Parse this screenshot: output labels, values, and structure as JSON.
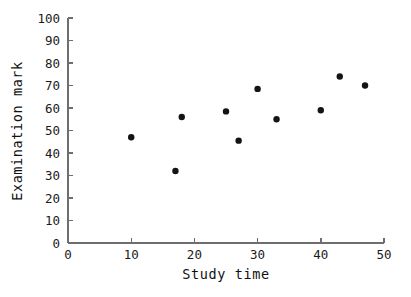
{
  "chart_data": {
    "type": "scatter",
    "title": "",
    "xlabel": "Study time",
    "ylabel": "Examination mark",
    "xlim": [
      0,
      50
    ],
    "ylim": [
      0,
      100
    ],
    "xticks": [
      0,
      10,
      20,
      30,
      40,
      50
    ],
    "yticks": [
      0,
      10,
      20,
      30,
      40,
      50,
      60,
      70,
      80,
      90,
      100
    ],
    "xtick_labels": [
      "0",
      "10",
      "20",
      "30",
      "40",
      "50"
    ],
    "ytick_labels": [
      "0",
      "10",
      "20",
      "30",
      "40",
      "50",
      "60",
      "70",
      "80",
      "90",
      "100"
    ],
    "grid": false,
    "legend": null,
    "marker": "filled-circle",
    "marker_color": "#141414",
    "axis_color": "#6e6e6e",
    "points": [
      {
        "x": 10,
        "y": 47
      },
      {
        "x": 17,
        "y": 32
      },
      {
        "x": 18,
        "y": 56
      },
      {
        "x": 25,
        "y": 58.5
      },
      {
        "x": 27,
        "y": 45.5
      },
      {
        "x": 30,
        "y": 68.5
      },
      {
        "x": 33,
        "y": 55
      },
      {
        "x": 40,
        "y": 59
      },
      {
        "x": 43,
        "y": 74
      },
      {
        "x": 47,
        "y": 70
      }
    ]
  },
  "figure": {
    "background": "#ffffff",
    "plot_area": {
      "left": 68,
      "right": 384,
      "top": 18,
      "bottom": 243
    }
  }
}
